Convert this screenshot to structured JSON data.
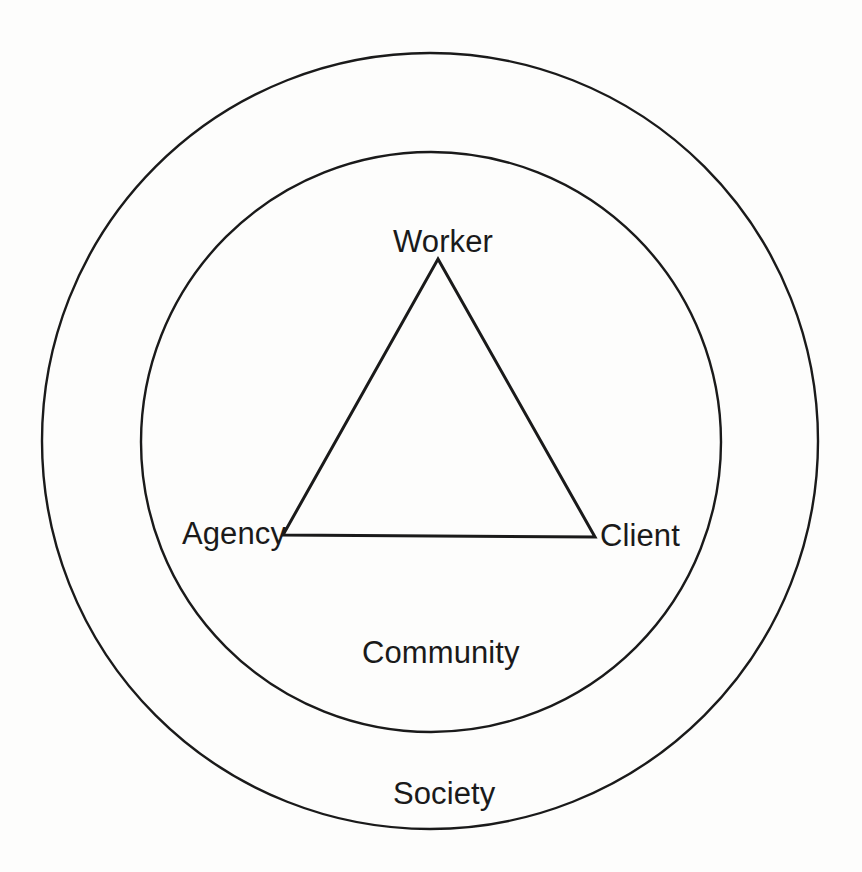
{
  "diagram": {
    "type": "concentric-circles-with-triangle",
    "title": "",
    "background_color": "#fdfdfc",
    "stroke_color": "#1a1a1a",
    "text_color": "#1a1a1a",
    "rings": [
      {
        "id": "outer-ring",
        "label": "Society",
        "center": {
          "x": 430,
          "y": 441
        },
        "radius": 388,
        "stroke_width": 2.4
      },
      {
        "id": "inner-ring",
        "label": "Community",
        "center": {
          "x": 431,
          "y": 442
        },
        "radius": 290,
        "stroke_width": 2.4
      }
    ],
    "triangle": {
      "id": "core-triangle",
      "stroke_width": 3,
      "vertices": [
        {
          "label": "Worker",
          "x": 438,
          "y": 259
        },
        {
          "label": "Client",
          "x": 595,
          "y": 537
        },
        {
          "label": "Agency",
          "x": 283,
          "y": 535
        }
      ]
    },
    "labels": {
      "worker": "Worker",
      "agency": "Agency",
      "client": "Client",
      "community": "Community",
      "society": "Society"
    }
  }
}
